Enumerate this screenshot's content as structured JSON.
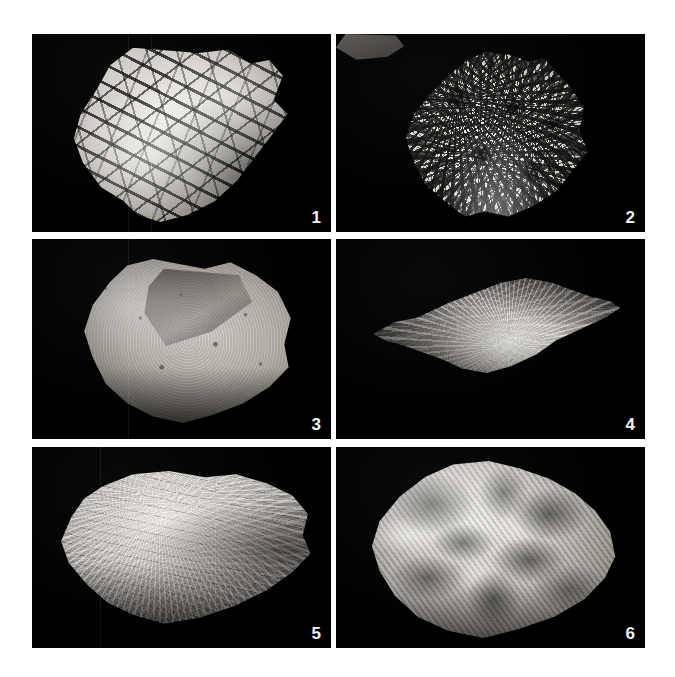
{
  "plate": {
    "background_color": "#ffffff",
    "panel_background_color": "#000000",
    "label_color": "#f2f2f2",
    "columns": 2,
    "rows": 3,
    "panel_count": 6,
    "panels": [
      {
        "number": "1",
        "position": "top-left",
        "label_corner": "bottom-right",
        "subject": "mineral specimen photograph",
        "description": "Interlocking bladed and prismatic dark crystals set in a pale matrix, random criss-cross orientation"
      },
      {
        "number": "2",
        "position": "top-right",
        "label_corner": "bottom-right",
        "subject": "mineral specimen photograph",
        "description": "Pale rock slab covered with dark radiating spherulitic crystal rosettes; a darker angular cap at the top"
      },
      {
        "number": "3",
        "position": "middle-left",
        "label_corner": "bottom-right",
        "subject": "mineral specimen photograph",
        "description": "Blocky granular massive rock with a darker cleavage face at upper centre and coarse speckled texture"
      },
      {
        "number": "4",
        "position": "middle-right",
        "label_corner": "bottom-right",
        "subject": "mineral specimen photograph",
        "description": "Thin elongate specimen, mostly dark, with a bright radiating fibrous spray near its centre"
      },
      {
        "number": "5",
        "position": "bottom-left",
        "label_corner": "bottom-right",
        "subject": "mineral specimen photograph",
        "description": "Broad silky fibrous mass with sweeping divergent striations across the whole upper surface"
      },
      {
        "number": "6",
        "position": "bottom-right",
        "label_corner": "bottom-right",
        "subject": "mineral specimen photograph",
        "description": "Rounded coarse-grained mass with strongly mottled light and dark patches"
      }
    ]
  }
}
